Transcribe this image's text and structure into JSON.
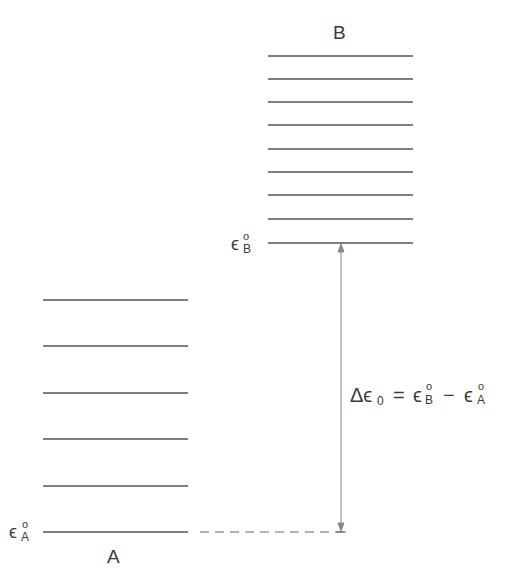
{
  "diagram": {
    "systems": [
      {
        "name": "A",
        "label": "A",
        "ground_label": "ϵ",
        "ground_sub": "A",
        "ground_sup": "o",
        "levels": 6
      },
      {
        "name": "B",
        "label": "B",
        "ground_label": "ϵ",
        "ground_sub": "B",
        "ground_sup": "o",
        "levels": 9
      }
    ],
    "gap": {
      "delta": "Δϵ",
      "delta_sub": "0",
      "equals": "=",
      "term1": "ϵ",
      "term1_sub": "B",
      "term1_sup": "o",
      "minus": "−",
      "term2": "ϵ",
      "term2_sub": "A",
      "term2_sup": "o"
    },
    "colors": {
      "line": "#555555",
      "arrow": "#888888",
      "text": "#3a3a3a"
    }
  }
}
